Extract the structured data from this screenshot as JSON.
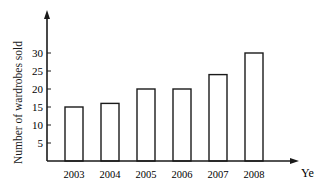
{
  "chart_data": {
    "type": "bar",
    "title": "",
    "xlabel": "Year",
    "ylabel": "Number of wardrobes sold",
    "categories": [
      "2003",
      "2004",
      "2005",
      "2006",
      "2007",
      "2008"
    ],
    "values": [
      15,
      16,
      20,
      20,
      24,
      30
    ],
    "yticks": [
      5,
      10,
      15,
      20,
      25,
      30
    ],
    "ylim": [
      0,
      35
    ],
    "grid": false,
    "legend": null,
    "bar_fill": "#ffffff",
    "bar_stroke": "#1a1a1a"
  }
}
